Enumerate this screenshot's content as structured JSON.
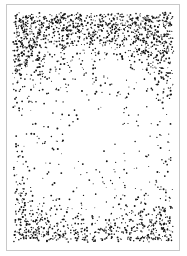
{
  "artwork": {
    "subject": "stippled radiant burst",
    "frame": {
      "x": 6,
      "y": 4,
      "width": 174,
      "height": 247,
      "border_color": "#c8c8c8"
    },
    "stipple": {
      "ink_color": "#111111",
      "burst_center": [
        94,
        135
      ],
      "burst_radius": 72,
      "ray_count": 36,
      "top_density": 0.85,
      "bottom_density": 0.45,
      "dot_count": 9000,
      "seed": 7
    }
  }
}
